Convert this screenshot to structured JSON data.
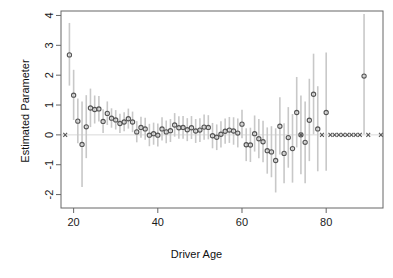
{
  "chart_data": {
    "type": "scatter",
    "title": "",
    "subtitle": "",
    "xlabel": "Driver Age",
    "ylabel": "Estimated Parameter",
    "xlim": [
      17,
      93.5
    ],
    "ylim": [
      -2.45,
      4.15
    ],
    "xticks": [
      20,
      40,
      60,
      80
    ],
    "yticks": [
      -2,
      -1,
      0,
      1,
      2,
      3,
      4
    ],
    "grid": false,
    "legend": null,
    "annotations": [
      "Horizontal reference line at y = 0",
      "Vertical grey segments are confidence intervals",
      "Open circles are estimates; x-marks are reference/fixed categories at 0"
    ],
    "colors": {
      "point": "#555555",
      "interval": "#c8c8c8",
      "axis": "#666666",
      "zero_line": "#d9d9d9",
      "text": "#1a1a1a",
      "background": "#ffffff"
    },
    "series": [
      {
        "name": "Estimated Parameter",
        "marker": "circle",
        "x": [
          19,
          20,
          21,
          22,
          23,
          24,
          25,
          26,
          27,
          28,
          29,
          30,
          31,
          32,
          33,
          34,
          35,
          36,
          37,
          38,
          39,
          40,
          41,
          42,
          43,
          44,
          45,
          46,
          47,
          48,
          49,
          50,
          51,
          52,
          53,
          54,
          55,
          56,
          57,
          58,
          59,
          60,
          61,
          62,
          63,
          64,
          65,
          66,
          67,
          68,
          69,
          70,
          71,
          72,
          73,
          74,
          75,
          76,
          77,
          78,
          80,
          89
        ],
        "y": [
          2.68,
          1.33,
          0.46,
          -0.32,
          0.27,
          0.9,
          0.85,
          0.87,
          0.45,
          0.72,
          0.56,
          0.5,
          0.38,
          0.43,
          0.54,
          0.43,
          0.1,
          0.25,
          0.2,
          -0.01,
          0.04,
          -0.01,
          0.2,
          0.1,
          0.14,
          0.33,
          0.24,
          0.25,
          0.17,
          0.24,
          0.13,
          0.16,
          0.26,
          0.25,
          -0.03,
          -0.08,
          0.02,
          0.12,
          0.16,
          0.13,
          0.06,
          0.36,
          -0.33,
          -0.34,
          0.04,
          -0.13,
          -0.23,
          -0.53,
          -0.57,
          -0.86,
          0.29,
          -0.62,
          -0.09,
          -0.46,
          0.75,
          0.0,
          -0.25,
          0.49,
          1.36,
          0.2,
          0.75,
          1.97
        ],
        "ylo": [
          1.65,
          0.5,
          -0.28,
          -1.75,
          -0.78,
          0.26,
          0.38,
          0.45,
          0.06,
          0.33,
          0.24,
          0.18,
          0.06,
          0.12,
          0.21,
          0.09,
          -0.25,
          -0.1,
          -0.16,
          -0.38,
          -0.33,
          -0.39,
          -0.19,
          -0.28,
          -0.24,
          -0.06,
          -0.13,
          -0.13,
          -0.21,
          -0.14,
          -0.27,
          -0.24,
          -0.16,
          -0.15,
          -0.45,
          -0.51,
          -0.42,
          -0.3,
          -0.27,
          -0.33,
          -0.42,
          -0.11,
          -0.88,
          -0.91,
          -0.56,
          -0.78,
          -0.92,
          -1.3,
          -1.42,
          -1.93,
          -0.66,
          -1.62,
          -1.1,
          -1.6,
          -0.42,
          -1.32,
          -1.62,
          -0.88,
          0.02,
          -1.22,
          -1.2,
          0.02
        ],
        "yhi": [
          3.75,
          2.18,
          1.22,
          1.12,
          1.33,
          1.55,
          1.32,
          1.3,
          0.86,
          1.12,
          0.89,
          0.83,
          0.71,
          0.76,
          0.88,
          0.78,
          0.46,
          0.61,
          0.57,
          0.37,
          0.41,
          0.38,
          0.59,
          0.48,
          0.53,
          0.73,
          0.62,
          0.63,
          0.56,
          0.63,
          0.53,
          0.56,
          0.68,
          0.66,
          0.4,
          0.35,
          0.46,
          0.55,
          0.6,
          0.59,
          0.55,
          0.84,
          0.22,
          0.24,
          0.65,
          0.53,
          0.47,
          0.25,
          0.29,
          0.22,
          1.26,
          0.39,
          0.93,
          0.7,
          1.94,
          1.32,
          1.12,
          1.88,
          2.72,
          1.63,
          2.76,
          4.05
        ]
      },
      {
        "name": "Reference categories",
        "marker": "x",
        "x": [
          18,
          74,
          79,
          81,
          82,
          83,
          84,
          85,
          86,
          87,
          88,
          90,
          93
        ],
        "y": [
          0,
          0,
          0,
          0,
          0,
          0,
          0,
          0,
          0,
          0,
          0,
          0,
          0
        ]
      }
    ]
  },
  "axes": {
    "x_tick_labels": [
      "20",
      "40",
      "60",
      "80"
    ],
    "y_tick_labels": [
      "4",
      "3",
      "2",
      "1",
      "0",
      "-1",
      "-2"
    ],
    "x_axis_label": "Driver Age",
    "y_axis_label": "Estimated Parameter"
  }
}
